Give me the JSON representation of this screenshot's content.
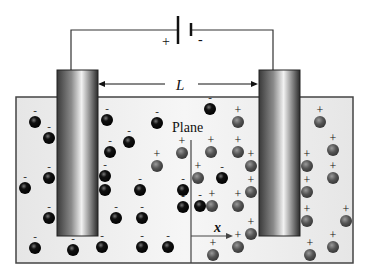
{
  "diagram": {
    "battery": {
      "plus_label": "+",
      "minus_label": "-"
    },
    "distance_label": "L",
    "plane_label": "Plane",
    "axis_label": "x",
    "colors": {
      "container_fill": "#eeeeee",
      "container_stroke": "#444444",
      "negative_ion": "#111111",
      "positive_ion": "#555555",
      "wire": "#333333"
    },
    "negative_ions": [
      [
        35,
        122
      ],
      [
        49,
        138
      ],
      [
        49,
        178
      ],
      [
        25,
        188
      ],
      [
        49,
        218
      ],
      [
        107,
        120
      ],
      [
        110,
        152
      ],
      [
        129,
        142
      ],
      [
        105,
        176
      ],
      [
        105,
        190
      ],
      [
        157,
        123
      ],
      [
        140,
        190
      ],
      [
        142,
        218
      ],
      [
        116,
        218
      ],
      [
        35,
        248
      ],
      [
        73,
        250
      ],
      [
        102,
        247
      ],
      [
        142,
        247
      ],
      [
        168,
        247
      ],
      [
        210,
        109
      ],
      [
        222,
        178
      ],
      [
        183,
        207
      ],
      [
        200,
        206
      ],
      [
        183,
        190
      ]
    ],
    "positive_ions": [
      [
        157,
        166
      ],
      [
        182,
        153
      ],
      [
        238,
        122
      ],
      [
        211,
        152
      ],
      [
        238,
        152
      ],
      [
        251,
        166
      ],
      [
        198,
        178
      ],
      [
        251,
        192
      ],
      [
        212,
        206
      ],
      [
        238,
        206
      ],
      [
        251,
        234
      ],
      [
        213,
        255
      ],
      [
        238,
        247
      ],
      [
        320,
        122
      ],
      [
        333,
        150
      ],
      [
        333,
        178
      ],
      [
        307,
        166
      ],
      [
        307,
        192
      ],
      [
        307,
        221
      ],
      [
        346,
        221
      ],
      [
        333,
        247
      ],
      [
        310,
        255
      ]
    ]
  }
}
